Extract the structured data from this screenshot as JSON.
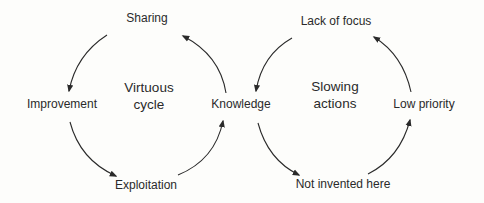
{
  "diagram": {
    "type": "cycle-diagram",
    "cycles": [
      {
        "title_line1": "Virtuous",
        "title_line2": "cycle",
        "nodes": [
          "Sharing",
          "Improvement",
          "Exploitation",
          "Knowledge"
        ],
        "direction": "counter-clockwise"
      },
      {
        "title_line1": "Slowing",
        "title_line2": "actions",
        "nodes": [
          "Lack of focus",
          "Knowledge",
          "Not invented here",
          "Low priority"
        ],
        "direction": "counter-clockwise"
      }
    ],
    "labels": {
      "sharing": "Sharing",
      "improvement": "Improvement",
      "exploitation": "Exploitation",
      "knowledge": "Knowledge",
      "lack_of_focus": "Lack of focus",
      "not_invented_here": "Not invented here",
      "low_priority": "Low priority"
    },
    "colors": {
      "background": "#fdfdfb",
      "stroke": "#2a2a2a",
      "text": "#2a2a2a"
    }
  }
}
